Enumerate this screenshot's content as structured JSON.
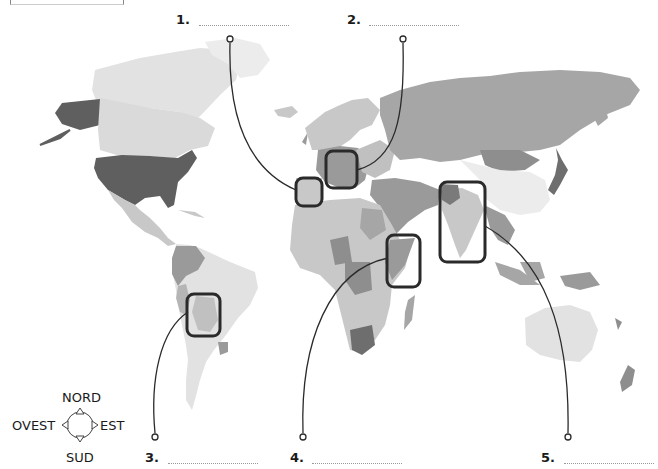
{
  "exercise": {
    "answers": [
      {
        "number": "1.",
        "value": ""
      },
      {
        "number": "2.",
        "value": ""
      },
      {
        "number": "3.",
        "value": ""
      },
      {
        "number": "4.",
        "value": ""
      },
      {
        "number": "5.",
        "value": ""
      }
    ]
  },
  "compass": {
    "north": "NORD",
    "south": "SUD",
    "east": "EST",
    "west": "OVEST"
  },
  "highlighted_regions": [
    {
      "id": 1,
      "region": "Iberian Peninsula"
    },
    {
      "id": 2,
      "region": "Italy"
    },
    {
      "id": 3,
      "region": "Bolivia"
    },
    {
      "id": 4,
      "region": "Somalia"
    },
    {
      "id": 5,
      "region": "India"
    }
  ],
  "colors": {
    "dark_country": "#5f5f5f",
    "mid_country": "#9a9a9a",
    "light_country": "#c8c8c8",
    "pale_country": "#e2e2e2",
    "box_stroke": "#2a2a2a",
    "leader_line": "#2a2a2a"
  }
}
